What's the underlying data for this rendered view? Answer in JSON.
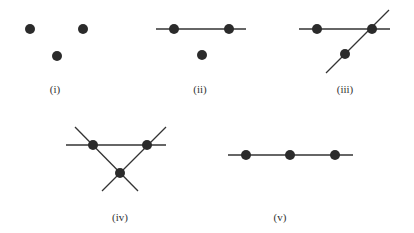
{
  "figure": {
    "panels": [
      {
        "id": "i",
        "label": "(i)",
        "points": 3,
        "lines": 0,
        "description": "three points, no lines"
      },
      {
        "id": "ii",
        "label": "(ii)",
        "points": 3,
        "lines": 1,
        "description": "one line through two points, third point isolated"
      },
      {
        "id": "iii",
        "label": "(iii)",
        "points": 3,
        "lines": 2,
        "description": "two intersecting lines, one point at the intersection"
      },
      {
        "id": "iv",
        "label": "(iv)",
        "points": 3,
        "lines": 3,
        "description": "three lines forming a triangle, points at intersections"
      },
      {
        "id": "v",
        "label": "(v)",
        "points": 3,
        "lines": 1,
        "description": "three collinear points on one line"
      }
    ],
    "colors": {
      "stroke": "#333333",
      "point": "#2b2b2b",
      "background": "#ffffff"
    }
  }
}
